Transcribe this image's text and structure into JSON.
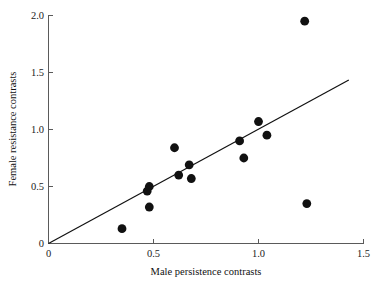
{
  "chart_data": {
    "type": "scatter",
    "title": "",
    "xlabel": "Male persistence contrasts",
    "ylabel": "Female resistance contrasts",
    "xlim": [
      0,
      1.5
    ],
    "ylim": [
      0,
      2.0
    ],
    "xticks": [
      "0",
      "0.5",
      "1.0",
      "1.5"
    ],
    "xtick_values": [
      0,
      0.5,
      1.0,
      1.5
    ],
    "yticks": [
      "0",
      "0.5",
      "1.0",
      "1.5",
      "2.0"
    ],
    "ytick_values": [
      0,
      0.5,
      1.0,
      1.5,
      2.0
    ],
    "grid": false,
    "legend": null,
    "marker": "filled-circle",
    "marker_color": "#111111",
    "points": [
      {
        "x": 0.35,
        "y": 0.13
      },
      {
        "x": 0.47,
        "y": 0.46
      },
      {
        "x": 0.48,
        "y": 0.5
      },
      {
        "x": 0.48,
        "y": 0.32
      },
      {
        "x": 0.6,
        "y": 0.84
      },
      {
        "x": 0.62,
        "y": 0.6
      },
      {
        "x": 0.67,
        "y": 0.69
      },
      {
        "x": 0.68,
        "y": 0.57
      },
      {
        "x": 0.91,
        "y": 0.9
      },
      {
        "x": 0.93,
        "y": 0.75
      },
      {
        "x": 1.0,
        "y": 1.07
      },
      {
        "x": 1.04,
        "y": 0.95
      },
      {
        "x": 1.22,
        "y": 1.95
      },
      {
        "x": 1.23,
        "y": 0.35
      }
    ],
    "fit_line": {
      "type": "linear-regression-through-origin",
      "x_start": 0.0,
      "y_start": 0.0,
      "x_end": 1.43,
      "y_end": 1.435,
      "color": "#111111"
    }
  }
}
